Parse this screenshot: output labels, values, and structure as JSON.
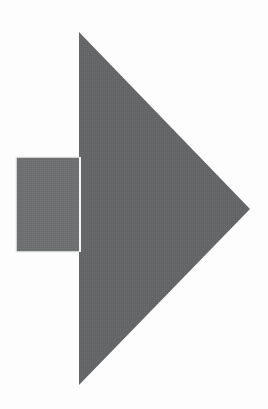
{
  "canvas": {
    "width": 268,
    "height": 409,
    "background_color": "#fdfdfd"
  },
  "figure": {
    "name": "arrow-glyph",
    "outline_color": "#f2f2f2"
  },
  "shapes": {
    "tail": {
      "label": "arrow-tail-rectangle",
      "type": "rect",
      "x": 16,
      "y": 157,
      "width": 64,
      "height": 95,
      "fill": "#6e7072"
    },
    "head": {
      "label": "arrow-head-triangle",
      "type": "polygon",
      "points": "79,32 250,209 79,385",
      "apex_top": [
        79,
        32
      ],
      "apex_right": [
        250,
        209
      ],
      "apex_bottom": [
        79,
        385
      ],
      "fill": "#646668"
    },
    "separator": {
      "label": "tail-head-gap",
      "type": "rect",
      "x": 79,
      "y": 157,
      "width": 2,
      "height": 95,
      "fill": "#f4f4f4"
    }
  }
}
